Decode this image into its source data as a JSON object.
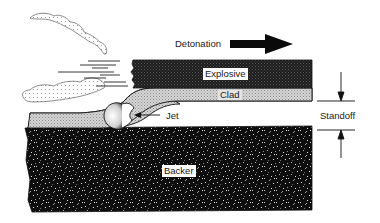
{
  "diagram": {
    "labels": {
      "detonation": "Detonation",
      "explosive": "Explosive",
      "clad": "Clad",
      "jet": "Jet",
      "standoff": "Standoff",
      "backer": "Backer"
    },
    "colors": {
      "explosive": "#1c1c1c",
      "clad": "#c8c8c8",
      "backer": "#0e0e0e",
      "line": "#111111",
      "background": "#ffffff"
    },
    "arrows": {
      "detonation_direction": "right",
      "jet_direction": "left",
      "standoff": "dimension between clad and backer"
    }
  }
}
